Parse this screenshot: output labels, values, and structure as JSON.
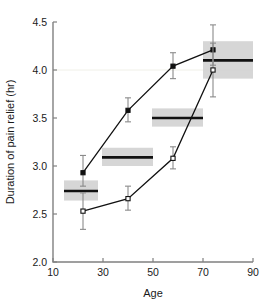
{
  "chart_data": {
    "type": "line",
    "title": "",
    "xlabel": "Age",
    "ylabel": "Duration of pain relief (hr)",
    "xlim": [
      10,
      90
    ],
    "ylim": [
      2.0,
      4.5
    ],
    "xticks": [
      10,
      30,
      50,
      70,
      90
    ],
    "xtick_labels": [
      "10",
      "30",
      "50",
      "70",
      "90"
    ],
    "yticks": [
      2.0,
      2.5,
      3.0,
      3.5,
      4.0,
      4.5
    ],
    "ytick_labels": [
      "2.0",
      "2.5",
      "3.0",
      "3.5",
      "4.0",
      "4.5"
    ],
    "grid": "single faint horizontal gridline at y = 4.0",
    "legend": "none",
    "x": [
      22,
      40,
      58,
      74
    ],
    "series": [
      {
        "name": "filled-square-series",
        "marker": "filled-square",
        "values": [
          2.93,
          3.58,
          4.04,
          4.21
        ],
        "error_low": [
          2.79,
          3.46,
          3.91,
          4.05
        ],
        "error_high": [
          3.11,
          3.71,
          4.18,
          4.47
        ]
      },
      {
        "name": "open-square-series",
        "marker": "open-square",
        "values": [
          2.53,
          2.66,
          3.08,
          4.0
        ],
        "error_low": [
          2.34,
          2.54,
          2.97,
          3.72
        ],
        "error_high": [
          2.72,
          2.79,
          3.2,
          4.28
        ]
      }
    ],
    "reference_bands": [
      {
        "label": "band-1",
        "x_start": 14.4,
        "x_end": 28.0,
        "level": 2.74,
        "band_low": 2.64,
        "band_high": 2.85
      },
      {
        "label": "band-2",
        "x_start": 29.6,
        "x_end": 50.0,
        "level": 3.09,
        "band_low": 3.0,
        "band_high": 3.19
      },
      {
        "label": "band-3",
        "x_start": 49.6,
        "x_end": 70.0,
        "level": 3.5,
        "band_low": 3.41,
        "band_high": 3.6
      },
      {
        "label": "band-4",
        "x_start": 70.0,
        "x_end": 90.0,
        "level": 4.1,
        "band_low": 3.91,
        "band_high": 4.3
      }
    ],
    "colors": {
      "marker_filled": "#111111",
      "marker_open": "#ffffff",
      "line": "#111111",
      "errorbar": "#8a8a8a",
      "band_fill": "#cfcfcf",
      "band_line": "#111111",
      "axis": "#808080",
      "gridline": "#f0f0e8",
      "background": "#ffffff"
    }
  }
}
